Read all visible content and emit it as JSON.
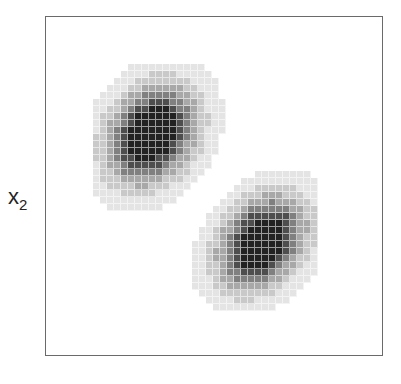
{
  "chart_data": {
    "type": "heatmap",
    "title": "",
    "xlabel": "",
    "ylabel_main": "x",
    "ylabel_sub": "2",
    "grid": false,
    "legend": null,
    "cell_size_px": 7,
    "plot_area_px": {
      "left": 45,
      "top": 16,
      "right": 383,
      "bottom": 356
    },
    "levels": [
      "#e4e4e4",
      "#c9c9c9",
      "#a8a8a8",
      "#808080",
      "#4e4e4e",
      "#222222"
    ],
    "clusters": [
      {
        "name": "upper-left",
        "cx": 152,
        "cy": 135,
        "sx": 33,
        "sy": 36,
        "rho": -0.25,
        "extent": {
          "x": [
            93,
            237
          ],
          "y": [
            64,
            218
          ]
        }
      },
      {
        "name": "lower-right",
        "cx": 262,
        "cy": 243,
        "sx": 32,
        "sy": 34,
        "rho": -0.3,
        "extent": {
          "x": [
            185,
            318
          ],
          "y": [
            157,
            310
          ]
        }
      }
    ]
  }
}
